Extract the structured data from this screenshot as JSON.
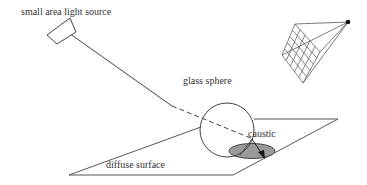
{
  "diagram": {
    "labels": {
      "light_source": "small area light source",
      "sphere": "glass sphere",
      "caustic": "caustic",
      "surface": "diffuse surface"
    },
    "colors": {
      "stroke": "#444444",
      "caustic_fill": "#9a9a9a",
      "background": "#ffffff"
    },
    "elements": [
      "small-area-light-source",
      "light-ray",
      "glass-sphere",
      "refracted-ray",
      "caustic-patch",
      "diffuse-surface-plane",
      "camera-image-grid",
      "camera-eye-point"
    ]
  }
}
